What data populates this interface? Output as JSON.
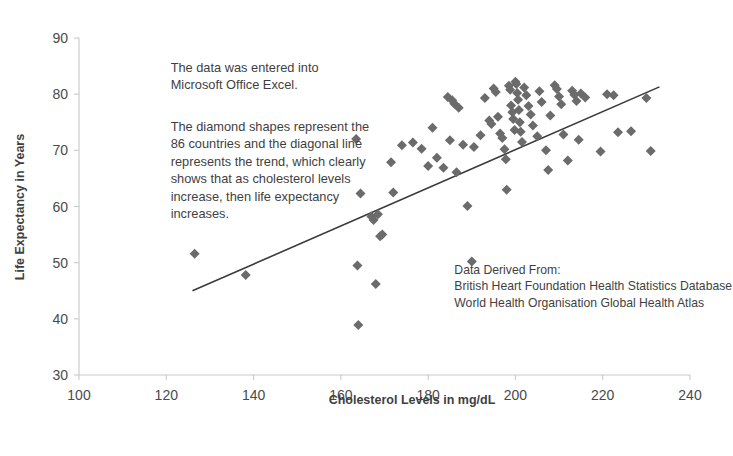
{
  "chart_data": {
    "type": "scatter",
    "title": "",
    "xlabel": "Cholesterol Levels in mg/dL",
    "ylabel": "Life Expectancy in Years",
    "xlim": [
      100,
      240
    ],
    "ylim": [
      30,
      90
    ],
    "xticks": [
      100,
      120,
      140,
      160,
      180,
      200,
      220,
      240
    ],
    "yticks": [
      30,
      40,
      50,
      60,
      70,
      80,
      90
    ],
    "grid": false,
    "legend": "none",
    "marker": "diamond",
    "marker_color": "#6b6b6b",
    "n_points": 86,
    "series": [
      {
        "name": "Countries",
        "points": [
          [
            126.5,
            51.6
          ],
          [
            138.2,
            47.8
          ],
          [
            163.5,
            72.0
          ],
          [
            163.8,
            49.5
          ],
          [
            164.0,
            38.9
          ],
          [
            164.5,
            62.3
          ],
          [
            167.0,
            58.2
          ],
          [
            167.5,
            57.6
          ],
          [
            168.0,
            46.2
          ],
          [
            168.5,
            58.6
          ],
          [
            169.0,
            54.7
          ],
          [
            169.5,
            55.0
          ],
          [
            171.5,
            67.9
          ],
          [
            172.0,
            62.5
          ],
          [
            174.0,
            70.9
          ],
          [
            176.5,
            71.4
          ],
          [
            178.5,
            70.3
          ],
          [
            180.0,
            67.2
          ],
          [
            181.0,
            74.0
          ],
          [
            182.0,
            68.7
          ],
          [
            183.5,
            66.9
          ],
          [
            184.5,
            79.5
          ],
          [
            185.0,
            71.8
          ],
          [
            185.5,
            78.9
          ],
          [
            186.0,
            78.3
          ],
          [
            186.5,
            66.1
          ],
          [
            187.0,
            77.6
          ],
          [
            188.0,
            71.0
          ],
          [
            189.0,
            60.1
          ],
          [
            190.0,
            50.2
          ],
          [
            190.5,
            70.6
          ],
          [
            192.0,
            72.7
          ],
          [
            193.0,
            79.3
          ],
          [
            194.0,
            75.3
          ],
          [
            194.5,
            74.7
          ],
          [
            195.0,
            81.0
          ],
          [
            195.5,
            80.4
          ],
          [
            196.0,
            76.0
          ],
          [
            196.5,
            73.0
          ],
          [
            197.0,
            72.2
          ],
          [
            197.5,
            70.2
          ],
          [
            197.8,
            68.4
          ],
          [
            198.0,
            63.0
          ],
          [
            198.5,
            81.5
          ],
          [
            198.8,
            80.8
          ],
          [
            199.0,
            78.0
          ],
          [
            199.3,
            76.8
          ],
          [
            199.5,
            75.6
          ],
          [
            199.8,
            73.6
          ],
          [
            200.0,
            82.2
          ],
          [
            200.2,
            81.8
          ],
          [
            200.4,
            80.2
          ],
          [
            200.6,
            79.0
          ],
          [
            200.8,
            77.2
          ],
          [
            201.0,
            75.0
          ],
          [
            201.2,
            73.3
          ],
          [
            201.5,
            71.5
          ],
          [
            202.0,
            81.2
          ],
          [
            202.5,
            79.8
          ],
          [
            203.0,
            77.9
          ],
          [
            203.5,
            76.4
          ],
          [
            204.0,
            74.4
          ],
          [
            205.0,
            72.5
          ],
          [
            205.5,
            80.5
          ],
          [
            206.0,
            78.6
          ],
          [
            207.0,
            70.0
          ],
          [
            207.5,
            66.5
          ],
          [
            208.0,
            76.2
          ],
          [
            209.0,
            81.6
          ],
          [
            209.5,
            80.9
          ],
          [
            210.0,
            79.6
          ],
          [
            210.5,
            78.2
          ],
          [
            211.0,
            72.8
          ],
          [
            212.0,
            68.2
          ],
          [
            213.0,
            80.6
          ],
          [
            213.5,
            79.9
          ],
          [
            214.0,
            78.8
          ],
          [
            214.5,
            71.9
          ],
          [
            215.0,
            80.1
          ],
          [
            216.0,
            79.4
          ],
          [
            219.5,
            69.8
          ],
          [
            221.0,
            80.0
          ],
          [
            222.5,
            79.8
          ],
          [
            223.5,
            73.2
          ],
          [
            226.5,
            73.4
          ],
          [
            230.0,
            79.3
          ],
          [
            231.0,
            69.9
          ]
        ]
      }
    ],
    "trendline": {
      "name": "Linear trend",
      "x_start": 126.0,
      "y_start": 45.0,
      "x_end": 233.0,
      "y_end": 81.3,
      "color": "#3a3a3a"
    },
    "annotations": [
      {
        "name": "method-note",
        "x": 121,
        "y": 84,
        "lines": [
          "The data was entered into",
          "Microsoft Office Excel."
        ]
      },
      {
        "name": "description-note",
        "x": 121,
        "y": 73.5,
        "lines": [
          "The diamond shapes represent the",
          "86 countries and the diagonal line",
          "represents the trend, which clearly",
          "shows that as cholesterol levels",
          "increase, then life expectancy",
          "increases."
        ]
      },
      {
        "name": "source-note",
        "x": 186,
        "y": 48,
        "lines": [
          "Data Derived From:",
          "British Heart Foundation Health Statistics Database",
          "World Health Organisation Global Health Atlas"
        ]
      }
    ]
  }
}
